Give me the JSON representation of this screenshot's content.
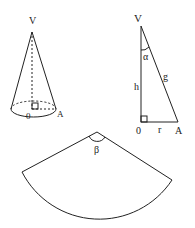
{
  "cone": {
    "apex_label": "V",
    "center_label": "0",
    "base_point_label": "A"
  },
  "triangle": {
    "apex_label": "V",
    "center_label": "0",
    "base_point_label": "A",
    "height_label": "h",
    "slant_label": "g",
    "radius_label": "r",
    "angle_label": "α"
  },
  "sector": {
    "angle_label": "β"
  },
  "colors": {
    "stroke": "#222222",
    "background": "#ffffff"
  }
}
